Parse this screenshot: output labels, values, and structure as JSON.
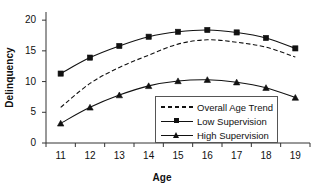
{
  "chart_data": {
    "type": "line",
    "title": "",
    "xlabel": "Age",
    "ylabel": "Delinquency",
    "categories": [
      "11",
      "12",
      "13",
      "14",
      "15",
      "16",
      "17",
      "18",
      "19"
    ],
    "x": [
      11,
      12,
      13,
      14,
      15,
      16,
      17,
      18,
      19
    ],
    "xlim": [
      10.5,
      19.5
    ],
    "ylim": [
      0,
      21
    ],
    "yticks": [
      "0",
      "5",
      "10",
      "15",
      "20"
    ],
    "ytick_values": [
      0,
      5,
      10,
      15,
      20
    ],
    "grid": false,
    "legend_position": "center-right-inside",
    "series": [
      {
        "name": "Overall Age Trend",
        "style": "dashed",
        "marker": "none",
        "color": "#111111",
        "values": [
          5.8,
          9.7,
          12.3,
          14.3,
          16.1,
          16.8,
          16.4,
          15.6,
          14.0
        ]
      },
      {
        "name": "Low Supervision",
        "style": "solid",
        "marker": "square",
        "color": "#111111",
        "values": [
          11.3,
          13.9,
          15.8,
          17.3,
          18.1,
          18.4,
          18.0,
          17.1,
          15.4
        ]
      },
      {
        "name": "High Supervision",
        "style": "solid",
        "marker": "triangle",
        "color": "#111111",
        "values": [
          3.2,
          5.8,
          7.8,
          9.3,
          10.1,
          10.3,
          9.9,
          9.0,
          7.4
        ]
      }
    ]
  },
  "axes": {
    "y_label": "Delinquency",
    "x_label": "Age",
    "y_tick_labels": [
      "20",
      "15",
      "10",
      "5",
      "0"
    ],
    "x_tick_labels": [
      "11",
      "12",
      "13",
      "14",
      "15",
      "16",
      "17",
      "18",
      "19"
    ]
  },
  "legend": {
    "items": [
      {
        "label": "Overall Age Trend",
        "sample": "dashed-line-sample"
      },
      {
        "label": "Low Supervision",
        "sample": "square-marker-line-sample"
      },
      {
        "label": "High Supervision",
        "sample": "triangle-marker-line-sample"
      }
    ]
  }
}
